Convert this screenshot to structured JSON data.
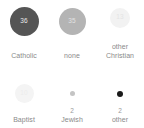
{
  "chart_data": {
    "type": "bar",
    "title": "",
    "subtitle": "",
    "xlabel": "",
    "ylabel": "",
    "legend": "none",
    "grid": false,
    "encoding": "bubble size and gray value encode the count",
    "categories": [
      "Catholic",
      "none",
      "other Christian",
      "Baptist",
      "Jewish",
      "other"
    ],
    "values": [
      36,
      35,
      13,
      10,
      2,
      2
    ],
    "items": [
      {
        "label": "Catholic",
        "value": 36,
        "value_text": "36",
        "bubble_px": 29,
        "bubble_color": "#555555",
        "value_color": "#e8e8e8",
        "value_inside": true
      },
      {
        "label": "none",
        "value": 35,
        "value_text": "35",
        "bubble_px": 27,
        "bubble_color": "#b4b4b4",
        "value_color": "#e2e2e2",
        "value_inside": true
      },
      {
        "label": "other\nChristian",
        "value": 13,
        "value_text": "13",
        "bubble_px": 20,
        "bubble_color": "#f2f2f2",
        "value_color": "#e4e4e4",
        "value_inside": true
      },
      {
        "label": "Baptist",
        "value": 10,
        "value_text": "10",
        "bubble_px": 19,
        "bubble_color": "#f4f4f4",
        "value_color": "#ececec",
        "value_inside": true
      },
      {
        "label": "Jewish",
        "value": 2,
        "value_text": "2",
        "bubble_px": 5,
        "bubble_color": "#c4c4c4",
        "value_color": "#9a9a9a",
        "value_inside": false
      },
      {
        "label": "other",
        "value": 2,
        "value_text": "2",
        "bubble_px": 6,
        "bubble_color": "#1a1a1a",
        "value_color": "#9a9a9a",
        "value_inside": false
      }
    ]
  }
}
